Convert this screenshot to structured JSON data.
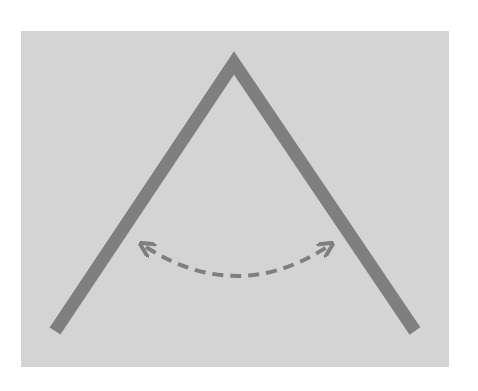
{
  "diagram": {
    "canvas": {
      "width": 478,
      "height": 391,
      "background": "#ffffff"
    },
    "panel": {
      "x": 21,
      "y": 31,
      "width": 428,
      "height": 336,
      "color": "#d4d4d4"
    },
    "angle_shape": {
      "color": "#7f7f7f",
      "stroke_width": 13,
      "apex": [
        234,
        63
      ],
      "left_end": [
        55,
        331
      ],
      "right_end": [
        415,
        331
      ]
    },
    "arc_arrow": {
      "color": "#7f7f7f",
      "stroke_width": 4,
      "dash": "11 7",
      "start": [
        146,
        247
      ],
      "control": [
        237,
        305
      ],
      "end": [
        327,
        247
      ],
      "heads": "both"
    }
  }
}
